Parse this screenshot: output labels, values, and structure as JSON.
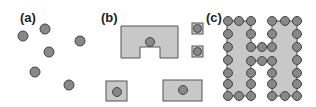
{
  "panels": [
    {
      "id": "a",
      "label": "(a)",
      "description": "scattered points"
    },
    {
      "id": "b",
      "label": "(b)",
      "description": "points enclosed by rectangular shapes"
    },
    {
      "id": "c",
      "label": "(c)",
      "description": "H-shaped region outlined by points"
    }
  ],
  "colors": {
    "point_fill": "#888888",
    "point_stroke": "#444444",
    "shape_fill": "#c8c8c8",
    "shape_stroke": "#555555",
    "line": "#444444"
  }
}
